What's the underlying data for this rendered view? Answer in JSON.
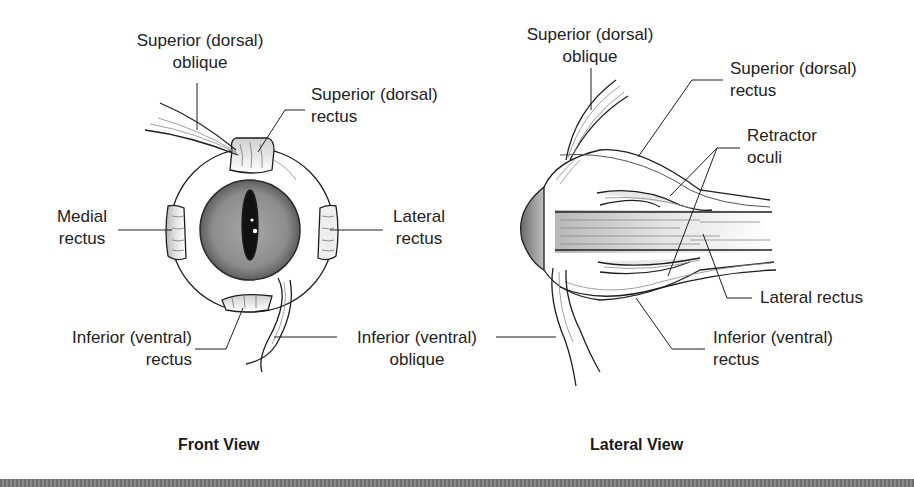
{
  "figure": {
    "views": [
      {
        "id": "front",
        "caption": "Front View",
        "labels": {
          "superior_oblique": [
            "Superior (dorsal)",
            "oblique"
          ],
          "superior_rectus": [
            "Superior (dorsal)",
            "rectus"
          ],
          "medial_rectus": [
            "Medial",
            "rectus"
          ],
          "lateral_rectus": [
            "Lateral",
            "rectus"
          ],
          "inferior_rectus": [
            "Inferior (ventral)",
            "rectus"
          ],
          "inferior_oblique": [
            "Inferior (ventral)",
            "oblique"
          ]
        }
      },
      {
        "id": "lateral",
        "caption": "Lateral View",
        "labels": {
          "superior_oblique": [
            "Superior (dorsal)",
            "oblique"
          ],
          "superior_rectus": [
            "Superior (dorsal)",
            "rectus"
          ],
          "retractor_oculi": [
            "Retractor",
            "oculi"
          ],
          "lateral_rectus": [
            "Lateral rectus"
          ],
          "inferior_rectus": [
            "Inferior (ventral)",
            "rectus"
          ]
        }
      }
    ],
    "colors": {
      "line": "#1e1e1e",
      "muscle": "#e6e6e6",
      "iris": "#8a8a8a",
      "pupil": "#111111",
      "bar": "#7a7a7a"
    }
  }
}
